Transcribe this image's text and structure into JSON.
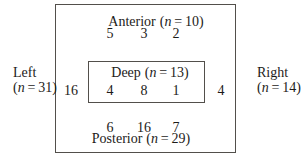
{
  "notation": {
    "open": "(",
    "var": "n",
    "eq": " = ",
    "close": ")"
  },
  "outside": {
    "left": {
      "title": "Left",
      "count": "31"
    },
    "right": {
      "title": "Right",
      "count": "14"
    }
  },
  "regions": {
    "anterior": {
      "title": "Anterior",
      "count": "10",
      "values": [
        "5",
        "3",
        "2"
      ]
    },
    "deep": {
      "title": "Deep",
      "count": "13",
      "values": [
        "4",
        "8",
        "1"
      ]
    },
    "posterior": {
      "title": "Posterior",
      "count": "29",
      "values": [
        "6",
        "16",
        "7"
      ]
    },
    "left_value": "16",
    "right_value": "4"
  }
}
